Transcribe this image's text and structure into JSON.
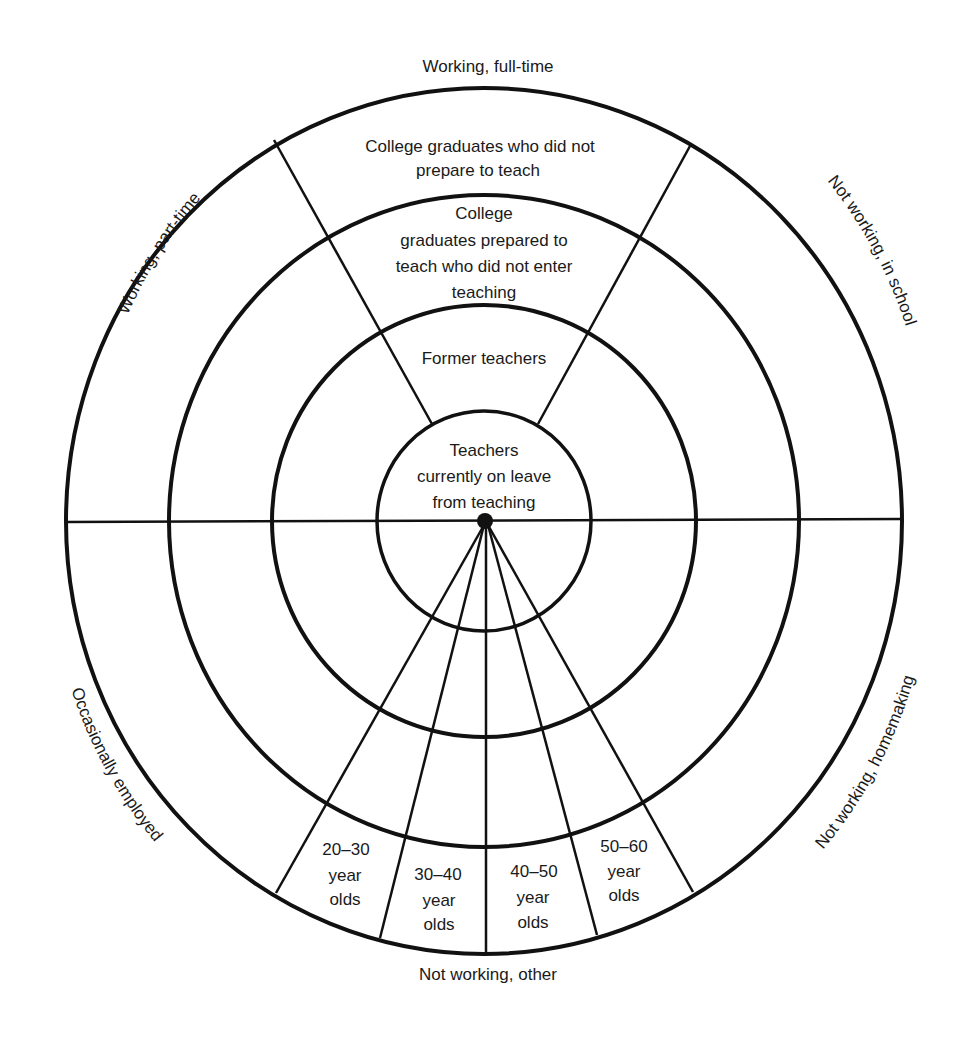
{
  "diagram": {
    "type": "concentric-ring-diagram",
    "rings": [
      {
        "level": 1,
        "label": "Teachers currently on leave from teaching",
        "lines": [
          "Teachers",
          "currently on leave",
          "from teaching"
        ]
      },
      {
        "level": 2,
        "label": "Former teachers",
        "lines": [
          "Former teachers"
        ]
      },
      {
        "level": 3,
        "label": "College graduates prepared to teach who did not enter teaching",
        "lines": [
          "College",
          "graduates prepared to",
          "teach who did not enter",
          "teaching"
        ]
      },
      {
        "level": 4,
        "label": "College graduates who did not prepare to teach",
        "lines": [
          "College graduates who did not",
          "prepare to teach"
        ]
      }
    ],
    "outer_categories": {
      "top": "Working, full-time",
      "upper_left": "Working, part-time",
      "upper_right": "Not working, in school",
      "lower_left": "Occasionally employed",
      "lower_right": "Not working, homemaking",
      "bottom": "Not working, other"
    },
    "age_groups": [
      {
        "range": "20–30",
        "line2": "year",
        "line3": "olds"
      },
      {
        "range": "30–40",
        "line2": "year",
        "line3": "olds"
      },
      {
        "range": "40–50",
        "line2": "year",
        "line3": "olds"
      },
      {
        "range": "50–60",
        "line2": "year",
        "line3": "olds"
      }
    ],
    "colors": {
      "stroke": "#111111",
      "background": "#ffffff",
      "text": "#1a1a1a"
    }
  }
}
